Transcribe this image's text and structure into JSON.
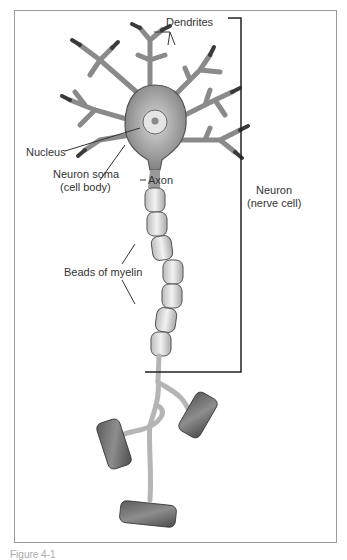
{
  "figure": {
    "caption": "Figure 4-1",
    "labels": {
      "dendrites": "Dendrites",
      "nucleus": "Nucleus",
      "soma_line1": "Neuron soma",
      "soma_line2": "(cell body)",
      "axon": "Axon",
      "neuron_line1": "Neuron",
      "neuron_line2": "(nerve cell)",
      "myelin": "Beads of myelin"
    }
  }
}
